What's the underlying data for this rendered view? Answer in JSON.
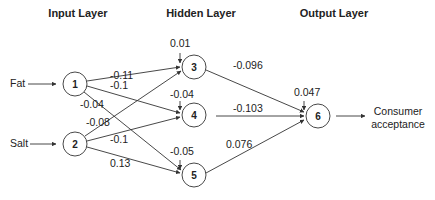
{
  "layers": {
    "input": "Input Layer",
    "hidden": "Hidden Layer",
    "output": "Output Layer"
  },
  "inputs": {
    "fat": "Fat",
    "salt": "Salt"
  },
  "output_label": {
    "line1": "Consumer",
    "line2": "acceptance"
  },
  "nodes": {
    "n1": "1",
    "n2": "2",
    "n3": "3",
    "n4": "4",
    "n5": "5",
    "n6": "6"
  },
  "biases": {
    "b3": "0.01",
    "b4": "-0.04",
    "b5": "-0.05",
    "b6": "0.047"
  },
  "weights": {
    "w13": "-0.11",
    "w14": "-0.1",
    "w15": "-0.04",
    "w23": "-0.08",
    "w24": "-0.1",
    "w25": "0.13",
    "w36": "-0.096",
    "w46": "-0.103",
    "w56": "0.076"
  }
}
